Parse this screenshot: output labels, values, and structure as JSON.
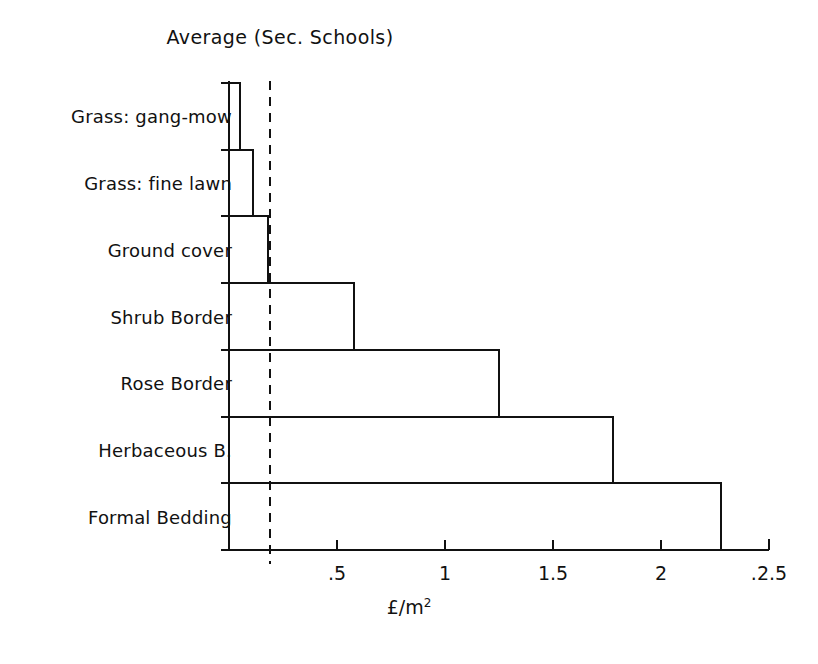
{
  "chart_data": {
    "type": "bar",
    "orientation": "horizontal",
    "title": "Average (Sec. Schools)",
    "xlabel": "£/m",
    "xlabel_superscript": "2",
    "ylabel": "",
    "categories": [
      "Grass: gang-mow",
      "Grass: fine lawn",
      "Ground cover",
      "Shrub Border",
      "Rose Border",
      "Herbaceous B.",
      "Formal Bedding"
    ],
    "values": [
      0.05,
      0.11,
      0.18,
      0.58,
      1.25,
      1.78,
      2.28
    ],
    "xlim": [
      0,
      2.5
    ],
    "xticks": [
      0.5,
      1,
      1.5,
      2,
      2.5
    ],
    "xtick_labels": [
      ".5",
      "1",
      "1.5",
      "2",
      ".2.5"
    ],
    "grid": false,
    "legend": null,
    "reference_line": {
      "value": 0.19,
      "style": "dashed",
      "orientation": "vertical"
    },
    "bar_style": {
      "fill": "#ffffff",
      "edge": "#111111",
      "edge_width": 2
    }
  },
  "figure": {
    "background": "#ffffff",
    "axis_color": "#111111"
  }
}
